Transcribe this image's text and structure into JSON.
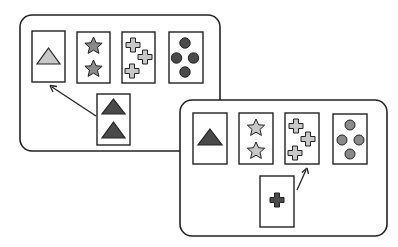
{
  "diagram": {
    "colors": {
      "outline": "#222222",
      "light_gray": "#c8c8c8",
      "mid_gray": "#8a8a8a",
      "dark_gray": "#4a4a4a",
      "background": "#ffffff"
    },
    "panels": [
      {
        "id": "panel-1",
        "key_cards": [
          {
            "shape": "triangle",
            "count": 1,
            "fill": "light"
          },
          {
            "shape": "star",
            "count": 2,
            "fill": "mid"
          },
          {
            "shape": "cross",
            "count": 3,
            "fill": "light"
          },
          {
            "shape": "circle",
            "count": 4,
            "fill": "dark"
          }
        ],
        "response_card": {
          "shape": "triangle",
          "count": 2,
          "fill": "dark"
        },
        "arrow_target": "key card 1 (matched by shape)"
      },
      {
        "id": "panel-2",
        "key_cards": [
          {
            "shape": "triangle",
            "count": 1,
            "fill": "dark"
          },
          {
            "shape": "star",
            "count": 2,
            "fill": "light"
          },
          {
            "shape": "cross",
            "count": 3,
            "fill": "light"
          },
          {
            "shape": "circle",
            "count": 4,
            "fill": "mid"
          }
        ],
        "response_card": {
          "shape": "cross",
          "count": 1,
          "fill": "dark"
        },
        "arrow_target": "key card 3 (matched by shape)"
      }
    ]
  }
}
